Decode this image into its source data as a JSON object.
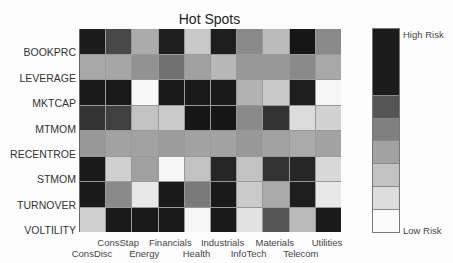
{
  "chart_data": {
    "type": "heatmap",
    "title": "Hot Spots",
    "rows": [
      "BOOKPRC",
      "LEVERAGE",
      "MKTCAP",
      "MTMOM",
      "RECENTROE",
      "STMOM",
      "TURNOVER",
      "VOLTILITY"
    ],
    "columns": [
      "ConsDisc",
      "ConsStap",
      "Energy",
      "Financials",
      "Health",
      "Industrials",
      "InfoTech",
      "Materials",
      "Telecom",
      "Utilities"
    ],
    "values_gray": [
      [
        "#1c1c1c",
        "#484848",
        "#ababab",
        "#1e1e1e",
        "#c8c8c8",
        "#1e1e1e",
        "#8a8a8a",
        "#bababa",
        "#161616",
        "#8a8a8a"
      ],
      [
        "#a8a8a8",
        "#a6a6a6",
        "#929292",
        "#727272",
        "#a0a0a0",
        "#b8b8b8",
        "#989898",
        "#989898",
        "#8a8a8a",
        "#a8a8a8"
      ],
      [
        "#1a1a1a",
        "#1a1a1a",
        "#f8f8f8",
        "#1a1a1a",
        "#1a1a1a",
        "#1a1a1a",
        "#b2b2b2",
        "#c8c8c8",
        "#1e1e1e",
        "#f6f6f6"
      ],
      [
        "#333333",
        "#404040",
        "#c2c2c2",
        "#cacaca",
        "#161616",
        "#161616",
        "#8a8a8a",
        "#333333",
        "#dcdcdc",
        "#d2d2d2"
      ],
      [
        "#989898",
        "#a2a2a2",
        "#a2a2a2",
        "#9c9c9c",
        "#a2a2a2",
        "#a2a2a2",
        "#989898",
        "#a2a2a2",
        "#aaaaaa",
        "#a2a2a2"
      ],
      [
        "#1a1a1a",
        "#d0d0d0",
        "#a0a0a0",
        "#f6f6f6",
        "#c2c2c2",
        "#262626",
        "#c2c2c2",
        "#333333",
        "#262626",
        "#d8d8d8"
      ],
      [
        "#1a1a1a",
        "#8a8a8a",
        "#e8e8e8",
        "#1a1a1a",
        "#7a7a7a",
        "#1a1a1a",
        "#cacaca",
        "#aaaaaa",
        "#1e1e1e",
        "#e8e8e8"
      ],
      [
        "#d0d0d0",
        "#1a1a1a",
        "#1a1a1a",
        "#1a1a1a",
        "#f6f6f6",
        "#1a1a1a",
        "#e2e2e2",
        "#555555",
        "#bababa",
        "#1a1a1a"
      ]
    ],
    "legend": {
      "high_label": "High Risk",
      "low_label": "Low Risk",
      "segments": [
        {
          "color": "#1c1c1c",
          "weight": 3
        },
        {
          "color": "#555555",
          "weight": 1
        },
        {
          "color": "#808080",
          "weight": 1
        },
        {
          "color": "#a2a2a2",
          "weight": 1
        },
        {
          "color": "#c2c2c2",
          "weight": 1
        },
        {
          "color": "#dcdcdc",
          "weight": 1
        },
        {
          "color": "#fafafa",
          "weight": 1
        }
      ]
    }
  }
}
